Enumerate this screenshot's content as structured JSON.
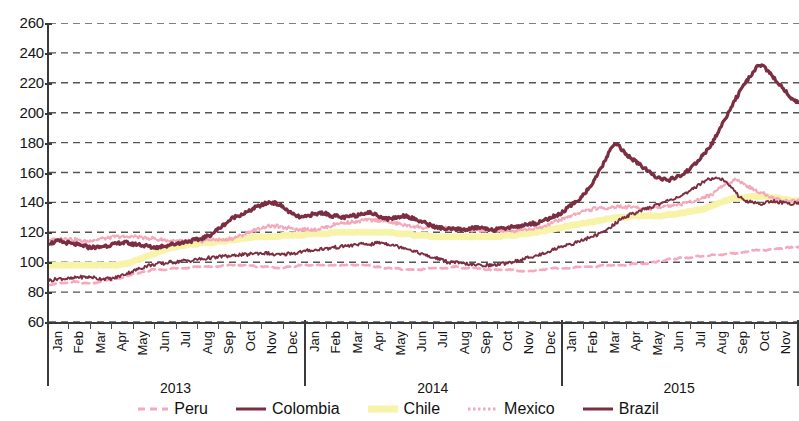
{
  "chart_data": {
    "type": "line",
    "title": "",
    "xlabel": "",
    "ylabel": "",
    "ylim": [
      60,
      260
    ],
    "ytick_step": 20,
    "yticks": [
      260,
      240,
      220,
      200,
      180,
      160,
      140,
      120,
      100,
      80,
      60
    ],
    "grid": true,
    "grid_style": "dashed-horizontal",
    "legend_position": "bottom-center",
    "months": [
      "Jan",
      "Feb",
      "Mar",
      "Apr",
      "May",
      "Jun",
      "Jul",
      "Aug",
      "Sep",
      "Oct",
      "Nov",
      "Dec"
    ],
    "years": [
      "2013",
      "2014",
      "2015"
    ],
    "x_last_month": "Nov",
    "x_note": "Daily index values, Jan 2013 through Nov 2015",
    "colors": {
      "peru": "#F5A8BE",
      "colombia": "#7B2D42",
      "chile": "#F7F3A8",
      "mexico": "#F3A9BC",
      "brazil": "#7B2D42",
      "axis": "#3a3a3a",
      "grid": "#555555",
      "background": "#ffffff"
    },
    "styles": {
      "peru": "dashed",
      "colombia": "solid",
      "chile": "solid-thick",
      "mexico": "dotted",
      "brazil": "solid-thick"
    },
    "series": [
      {
        "name": "Peru",
        "values": [
          85,
          85,
          86,
          86,
          86,
          86,
          87,
          87,
          86,
          86,
          86,
          86,
          86,
          87,
          88,
          88,
          88,
          89,
          89,
          90,
          91,
          92,
          92,
          93,
          94,
          94,
          95,
          95,
          95,
          95,
          95,
          96,
          96,
          96,
          96,
          96,
          97,
          97,
          97,
          97,
          97,
          97,
          97,
          97,
          98,
          98,
          98,
          98,
          98,
          98,
          98,
          98,
          97,
          97,
          97,
          97,
          97,
          96,
          96,
          96,
          97,
          97,
          97,
          98,
          98,
          98,
          98,
          98,
          98,
          98,
          98,
          98,
          98,
          98,
          98,
          98,
          98,
          98,
          98,
          98,
          98,
          98,
          97,
          97,
          96,
          96,
          96,
          96,
          96,
          95,
          95,
          95,
          95,
          95,
          95,
          96,
          96,
          96,
          96,
          96,
          96,
          96,
          97,
          97,
          96,
          96,
          96,
          96,
          96,
          96,
          95,
          95,
          95,
          95,
          95,
          95,
          95,
          95,
          94,
          94,
          94,
          94,
          94,
          95,
          95,
          95,
          96,
          96,
          96,
          96,
          96,
          96,
          96,
          97,
          97,
          97,
          97,
          97,
          97,
          98,
          98,
          98,
          98,
          98,
          98,
          98,
          98,
          99,
          99,
          99,
          99,
          99,
          100,
          100,
          101,
          101,
          102,
          102,
          102,
          103,
          103,
          103,
          103,
          104,
          104,
          104,
          104,
          105,
          105,
          105,
          105,
          106,
          106,
          106,
          106,
          107,
          107,
          108,
          108,
          108,
          108,
          108,
          109,
          109,
          109,
          109,
          110,
          110,
          110,
          110
        ]
      },
      {
        "name": "Colombia",
        "values": [
          88,
          88,
          89,
          89,
          89,
          89,
          89,
          90,
          90,
          90,
          90,
          90,
          89,
          89,
          89,
          89,
          89,
          90,
          91,
          92,
          93,
          94,
          95,
          96,
          97,
          98,
          98,
          99,
          99,
          99,
          100,
          100,
          100,
          101,
          101,
          101,
          101,
          102,
          102,
          102,
          103,
          103,
          103,
          104,
          104,
          104,
          104,
          105,
          105,
          105,
          105,
          106,
          106,
          106,
          106,
          106,
          105,
          105,
          105,
          105,
          106,
          106,
          106,
          107,
          107,
          108,
          108,
          108,
          109,
          109,
          109,
          110,
          110,
          110,
          111,
          111,
          111,
          112,
          112,
          112,
          112,
          112,
          113,
          113,
          113,
          112,
          112,
          111,
          110,
          110,
          109,
          108,
          107,
          106,
          105,
          104,
          103,
          103,
          102,
          101,
          100,
          100,
          100,
          99,
          99,
          99,
          98,
          98,
          98,
          98,
          98,
          98,
          98,
          99,
          99,
          100,
          100,
          101,
          101,
          102,
          103,
          104,
          104,
          105,
          106,
          107,
          108,
          109,
          110,
          111,
          112,
          112,
          113,
          114,
          115,
          116,
          117,
          118,
          119,
          120,
          122,
          124,
          126,
          128,
          130,
          131,
          132,
          133,
          134,
          135,
          136,
          137,
          138,
          139,
          140,
          141,
          142,
          143,
          144,
          145,
          146,
          148,
          150,
          152,
          154,
          155,
          156,
          157,
          156,
          155,
          153,
          150,
          147,
          144,
          142,
          141,
          140,
          140,
          139,
          139,
          140,
          141,
          141,
          140,
          140,
          139,
          139,
          140,
          140
        ]
      },
      {
        "name": "Chile",
        "values": [
          98,
          98,
          98,
          98,
          98,
          98,
          98,
          98,
          98,
          98,
          98,
          98,
          98,
          98,
          98,
          98,
          98,
          98,
          99,
          99,
          100,
          101,
          102,
          103,
          104,
          105,
          106,
          107,
          108,
          109,
          110,
          110,
          111,
          111,
          112,
          112,
          112,
          113,
          113,
          113,
          113,
          114,
          114,
          114,
          115,
          115,
          115,
          116,
          116,
          116,
          117,
          117,
          117,
          117,
          117,
          117,
          117,
          118,
          118,
          118,
          118,
          118,
          118,
          119,
          119,
          119,
          119,
          119,
          119,
          120,
          120,
          120,
          120,
          120,
          120,
          120,
          120,
          120,
          120,
          120,
          120,
          120,
          120,
          120,
          120,
          119,
          119,
          119,
          119,
          118,
          118,
          118,
          118,
          117,
          117,
          117,
          117,
          117,
          117,
          117,
          117,
          117,
          117,
          117,
          117,
          117,
          117,
          117,
          117,
          117,
          117,
          118,
          118,
          118,
          118,
          119,
          119,
          119,
          120,
          120,
          121,
          121,
          122,
          122,
          123,
          123,
          124,
          124,
          125,
          125,
          126,
          126,
          127,
          127,
          128,
          128,
          129,
          129,
          130,
          130,
          130,
          130,
          131,
          131,
          131,
          131,
          131,
          131,
          131,
          131,
          131,
          132,
          132,
          132,
          133,
          133,
          134,
          134,
          135,
          135,
          136,
          137,
          138,
          139,
          140,
          141,
          142,
          143,
          143,
          143,
          143,
          144,
          144,
          144,
          144,
          144,
          143,
          143,
          143,
          142,
          142,
          141,
          141,
          141
        ]
      },
      {
        "name": "Mexico",
        "values": [
          115,
          115,
          115,
          116,
          116,
          116,
          115,
          115,
          114,
          114,
          114,
          115,
          115,
          116,
          116,
          116,
          117,
          117,
          117,
          117,
          117,
          117,
          117,
          117,
          116,
          116,
          116,
          115,
          115,
          115,
          114,
          114,
          114,
          114,
          114,
          114,
          114,
          114,
          114,
          115,
          115,
          115,
          115,
          115,
          115,
          116,
          116,
          117,
          118,
          119,
          120,
          121,
          122,
          123,
          124,
          124,
          124,
          124,
          123,
          123,
          123,
          123,
          122,
          122,
          122,
          122,
          122,
          122,
          123,
          123,
          124,
          125,
          126,
          126,
          126,
          127,
          127,
          127,
          128,
          128,
          128,
          128,
          128,
          128,
          127,
          127,
          126,
          126,
          125,
          125,
          124,
          124,
          124,
          123,
          123,
          123,
          123,
          123,
          123,
          123,
          122,
          122,
          122,
          122,
          121,
          121,
          121,
          121,
          121,
          121,
          121,
          121,
          121,
          121,
          121,
          121,
          121,
          122,
          122,
          122,
          122,
          123,
          123,
          124,
          125,
          126,
          127,
          128,
          129,
          130,
          131,
          132,
          133,
          134,
          135,
          135,
          136,
          136,
          136,
          136,
          137,
          137,
          137,
          137,
          137,
          137,
          137,
          136,
          136,
          136,
          136,
          137,
          137,
          137,
          138,
          138,
          138,
          139,
          139,
          140,
          141,
          141,
          142,
          143,
          144,
          145,
          147,
          149,
          151,
          153,
          154,
          155,
          155,
          153,
          151,
          150,
          148,
          147,
          146,
          145,
          144,
          143,
          142,
          141,
          141,
          141,
          141,
          141
        ]
      },
      {
        "name": "Brazil",
        "values": [
          113,
          113,
          114,
          114,
          113,
          113,
          112,
          112,
          111,
          111,
          110,
          110,
          110,
          110,
          111,
          111,
          112,
          112,
          113,
          113,
          113,
          112,
          112,
          112,
          111,
          111,
          110,
          110,
          110,
          111,
          111,
          112,
          112,
          113,
          113,
          114,
          114,
          115,
          115,
          116,
          117,
          118,
          120,
          122,
          124,
          126,
          128,
          130,
          131,
          132,
          133,
          134,
          136,
          137,
          138,
          139,
          140,
          140,
          139,
          138,
          136,
          134,
          132,
          131,
          130,
          130,
          131,
          132,
          132,
          133,
          133,
          132,
          131,
          131,
          130,
          130,
          130,
          131,
          131,
          132,
          133,
          133,
          133,
          132,
          131,
          130,
          129,
          129,
          130,
          130,
          131,
          131,
          130,
          129,
          128,
          127,
          126,
          125,
          124,
          123,
          123,
          122,
          122,
          122,
          122,
          122,
          122,
          122,
          123,
          123,
          123,
          123,
          122,
          122,
          122,
          122,
          123,
          123,
          124,
          124,
          124,
          125,
          125,
          126,
          126,
          127,
          128,
          129,
          130,
          131,
          132,
          134,
          136,
          138,
          140,
          142,
          145,
          148,
          151,
          155,
          160,
          165,
          170,
          175,
          180,
          178,
          175,
          172,
          170,
          168,
          166,
          164,
          162,
          160,
          158,
          157,
          156,
          155,
          155,
          156,
          157,
          158,
          160,
          162,
          164,
          167,
          170,
          173,
          176,
          180,
          185,
          190,
          195,
          200,
          205,
          210,
          214,
          218,
          222,
          226,
          230,
          232,
          231,
          228,
          225,
          222,
          219,
          216,
          213,
          210,
          208,
          207
        ]
      }
    ]
  },
  "legend": {
    "items": [
      {
        "label": "Peru",
        "series": "Peru"
      },
      {
        "label": "Colombia",
        "series": "Colombia"
      },
      {
        "label": "Chile",
        "series": "Chile"
      },
      {
        "label": "Mexico",
        "series": "Mexico"
      },
      {
        "label": "Brazil",
        "series": "Brazil"
      }
    ]
  }
}
